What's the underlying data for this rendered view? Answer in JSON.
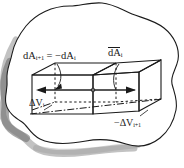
{
  "figure": {
    "background_color": "#ffffff",
    "ink_color": "#1a1a1a",
    "shadow_color": "#8c8c8c",
    "labels": {
      "area_pair": {
        "full_text": "dA(i+1) = -dA(i)",
        "lead": "dA",
        "sub_lead": "i+1",
        "equals": "= −dA",
        "sub_tail": "i"
      },
      "area_vector": {
        "full_text": "dA(i) vector",
        "symbol": "dA",
        "subscript": "i"
      },
      "volume_i": {
        "full_text": "ΔV(i)",
        "symbol": "ΔV",
        "subscript": "i"
      },
      "volume_ip1": {
        "full_text": "-ΔV(i+1)",
        "symbol": "−ΔV",
        "subscript": "i+1"
      }
    },
    "elements": {
      "blob_name": "irregular-closed-volume-outline",
      "prism_name": "rectangular-prism-two-cells",
      "arrow_left_name": "area-vector-arrow-left",
      "arrow_right_name": "area-vector-arrow-right",
      "center_point_name": "shared-face-center-point",
      "dashed_edges_name": "hidden-edges-dashed",
      "dashdot_name": "dash-dot-diagonal"
    }
  }
}
